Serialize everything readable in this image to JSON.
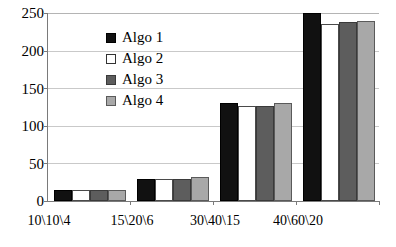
{
  "chart_data": {
    "type": "bar",
    "title": "",
    "subtitle": "",
    "xlabel": "",
    "ylabel": "",
    "categories": [
      "10\\10\\4",
      "15\\20\\6",
      "30\\40\\15",
      "40\\60\\20"
    ],
    "series": [
      {
        "name": "Algo 1",
        "color": "#111111",
        "values": [
          15,
          29,
          130,
          250
        ]
      },
      {
        "name": "Algo 2",
        "color": "#ffffff",
        "values": [
          15,
          29,
          126,
          235
        ]
      },
      {
        "name": "Algo 3",
        "color": "#5d5d5d",
        "values": [
          14,
          29,
          126,
          238
        ]
      },
      {
        "name": "Algo 4",
        "color": "#a8a8a8",
        "values": [
          15,
          32,
          130,
          239
        ]
      }
    ],
    "ylim": [
      0,
      250
    ],
    "yticks": [
      0,
      50,
      100,
      150,
      200,
      250
    ],
    "ytick_labels": [
      "0",
      "50",
      "100",
      "150",
      "200",
      "250"
    ],
    "grid": true,
    "grid_color": "#c9c9c9",
    "legend_position": "top-left",
    "axis_color": "#7a7a7a",
    "background": "#ffffff"
  },
  "legend": {
    "entries": [
      {
        "label": "Algo 1"
      },
      {
        "label": "Algo 2"
      },
      {
        "label": "Algo 3"
      },
      {
        "label": "Algo 4"
      }
    ]
  },
  "y_axis": {
    "labels": [
      "250",
      "200",
      "150",
      "100",
      "50",
      "0"
    ]
  },
  "x_axis": {
    "labels": [
      "10\\10\\4",
      "15\\20\\6",
      "30\\40\\15",
      "40\\60\\20"
    ]
  }
}
